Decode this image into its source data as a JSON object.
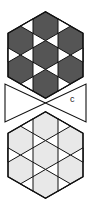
{
  "figure": {
    "top_hexagon": {
      "fill": "#555555",
      "triangle_fill": "#ffffff"
    },
    "bowtie": {
      "fill": "#ffffff",
      "label": "c"
    },
    "bottom_hexagon": {
      "fill": "#e8e8e8",
      "triangle_fill": "#ffffff"
    },
    "stroke": "#111111"
  }
}
